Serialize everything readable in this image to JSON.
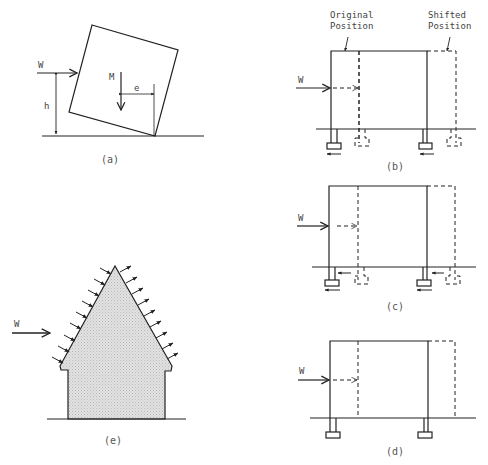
{
  "figure": {
    "panels": [
      {
        "id": "a",
        "caption": "(a)",
        "labels": {
          "force": "W",
          "height": "h",
          "weight": "M",
          "eccentricity": "e"
        }
      },
      {
        "id": "b",
        "caption": "(b)",
        "labels": {
          "force": "W",
          "original_line1": "Original",
          "original_line2": "Position",
          "shifted_line1": "Shifted",
          "shifted_line2": "Position"
        }
      },
      {
        "id": "c",
        "caption": "(c)",
        "labels": {
          "force": "W"
        }
      },
      {
        "id": "d",
        "caption": "(d)",
        "labels": {
          "force": "W"
        }
      },
      {
        "id": "e",
        "caption": "(e)",
        "labels": {
          "force": "W"
        }
      }
    ]
  },
  "colors": {
    "line": "#222222",
    "fill": "#d6d6d6",
    "text": "#444444"
  }
}
